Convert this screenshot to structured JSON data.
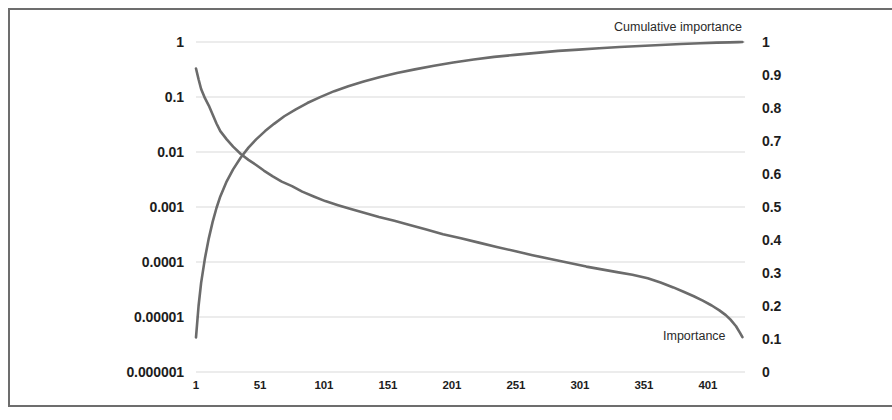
{
  "figure": {
    "title": "",
    "background_color": "#ffffff",
    "frame_color": "#6d6d6d",
    "series_color": "#6b6b6b",
    "gridline_color": "#d9d9d9"
  },
  "annotations": {
    "cumulative_label": "Cumulative importance",
    "importance_label": "Importance"
  },
  "axes": {
    "y_left": {
      "scale": "log",
      "ticks": [
        "1",
        "0.1",
        "0.01",
        "0.001",
        "0.0001",
        "0.00001",
        "0.000001"
      ]
    },
    "y_right": {
      "scale": "linear",
      "ticks": [
        "1",
        "0.9",
        "0.8",
        "0.7",
        "0.6",
        "0.5",
        "0.4",
        "0.3",
        "0.2",
        "0.1",
        "0"
      ]
    },
    "x": {
      "ticks": [
        "1",
        "51",
        "101",
        "151",
        "201",
        "251",
        "301",
        "351",
        "401"
      ]
    }
  },
  "chart_data": {
    "type": "line",
    "title": "",
    "xlabel": "",
    "ylabel": "",
    "grid": true,
    "legend_position": "inline-annotation",
    "x_ticks": [
      1,
      51,
      101,
      151,
      201,
      251,
      301,
      351,
      401
    ],
    "xlim": [
      1,
      430
    ],
    "y_left": {
      "name": "Importance",
      "scale": "log",
      "ylim": [
        1e-06,
        1
      ],
      "ticks": [
        1,
        0.1,
        0.01,
        0.001,
        0.0001,
        1e-05,
        1e-06
      ],
      "tick_labels": [
        "1",
        "0.1",
        "0.01",
        "0.001",
        "0.0001",
        "0.00001",
        "0.000001"
      ]
    },
    "y_right": {
      "name": "Cumulative importance",
      "scale": "linear",
      "ylim": [
        0,
        1
      ],
      "ticks": [
        0,
        0.1,
        0.2,
        0.3,
        0.4,
        0.5,
        0.6,
        0.7,
        0.8,
        0.9,
        1
      ],
      "tick_labels": [
        "0",
        "0.1",
        "0.2",
        "0.3",
        "0.4",
        "0.5",
        "0.6",
        "0.7",
        "0.8",
        "0.9",
        "1"
      ]
    },
    "series": [
      {
        "name": "Importance",
        "axis": "y_left",
        "color": "#6b6b6b",
        "x": [
          1,
          3,
          5,
          8,
          11,
          14,
          17,
          20,
          25,
          30,
          36,
          42,
          48,
          54,
          61,
          68,
          76,
          84,
          93,
          102,
          112,
          122,
          133,
          144,
          156,
          168,
          181,
          194,
          208,
          222,
          236,
          250,
          264,
          278,
          292,
          306,
          318,
          330,
          342,
          354,
          364,
          374,
          382,
          390,
          397,
          404,
          410,
          415,
          419,
          423,
          426,
          428
        ],
        "y": [
          0.33,
          0.21,
          0.14,
          0.095,
          0.07,
          0.048,
          0.033,
          0.024,
          0.017,
          0.0125,
          0.0092,
          0.0072,
          0.0058,
          0.0046,
          0.0036,
          0.0029,
          0.0024,
          0.0019,
          0.00155,
          0.00128,
          0.00108,
          0.00092,
          0.00078,
          0.00066,
          0.00056,
          0.00047,
          0.00039,
          0.00032,
          0.00027,
          0.000225,
          0.000188,
          0.000158,
          0.000133,
          0.000113,
          9.65e-05,
          8.25e-05,
          7.35e-05,
          6.55e-05,
          5.85e-05,
          5.05e-05,
          4.25e-05,
          3.45e-05,
          2.88e-05,
          2.38e-05,
          1.98e-05,
          1.62e-05,
          1.32e-05,
          1.08e-05,
          8.8e-06,
          6.8e-06,
          5.2e-06,
          4.3e-06
        ]
      },
      {
        "name": "Cumulative importance",
        "axis": "y_right",
        "color": "#6b6b6b",
        "x": [
          1,
          3,
          5,
          8,
          11,
          14,
          17,
          20,
          25,
          30,
          36,
          42,
          48,
          55,
          62,
          70,
          79,
          88,
          98,
          109,
          120,
          132,
          145,
          158,
          172,
          187,
          202,
          218,
          234,
          250,
          267,
          284,
          300,
          316,
          332,
          348,
          364,
          380,
          395,
          408,
          418,
          425,
          428
        ],
        "y": [
          0.105,
          0.2,
          0.27,
          0.345,
          0.405,
          0.455,
          0.497,
          0.532,
          0.578,
          0.614,
          0.65,
          0.68,
          0.705,
          0.73,
          0.752,
          0.775,
          0.796,
          0.815,
          0.833,
          0.851,
          0.866,
          0.88,
          0.894,
          0.906,
          0.917,
          0.928,
          0.938,
          0.947,
          0.955,
          0.961,
          0.967,
          0.973,
          0.977,
          0.981,
          0.985,
          0.988,
          0.991,
          0.994,
          0.996,
          0.998,
          0.999,
          0.9997,
          1.0
        ]
      }
    ]
  }
}
